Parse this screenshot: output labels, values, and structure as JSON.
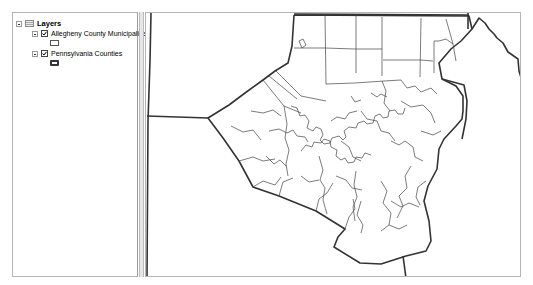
{
  "toc": {
    "root": {
      "label": "Layers",
      "icon": "layers-icon",
      "expanded": true
    },
    "layers": [
      {
        "label": "Allegheny County Municipalities",
        "checked": true,
        "expanded": true,
        "symbol": "thin-outline-polygon"
      },
      {
        "label": "Pennsylvania Counties",
        "checked": true,
        "expanded": true,
        "symbol": "thick-outline-polygon"
      }
    ]
  },
  "map": {
    "content": "Allegheny County municipal boundaries overlaid on Pennsylvania county boundaries",
    "colors": {
      "background": "#ffffff",
      "county_outline": "#333333",
      "municipal_outline": "#444444"
    }
  }
}
